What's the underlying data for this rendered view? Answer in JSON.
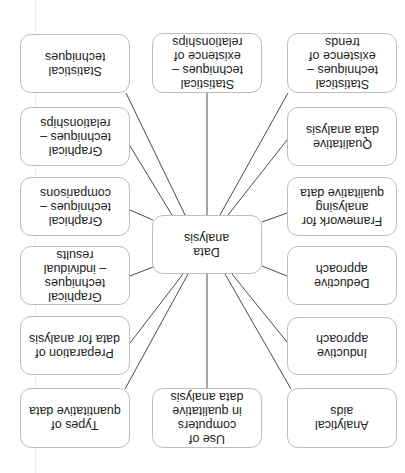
{
  "diagram": {
    "orientation": "rotated-180",
    "center": {
      "label": "Data\nanalysis"
    },
    "nodes": [
      {
        "id": "statistical-techniques",
        "label": "Statistical\ntechniques"
      },
      {
        "id": "graphical-relationships",
        "label": "Graphical\ntechniques –\nrelationships"
      },
      {
        "id": "graphical-comparisons",
        "label": "Graphical\ntechniques –\ncomparisons"
      },
      {
        "id": "graphical-individual-results",
        "label": "Graphical\ntechniques\n– individual results"
      },
      {
        "id": "preparation-of-data",
        "label": "Preparation of\ndata for analysis"
      },
      {
        "id": "types-of-quantitative-data",
        "label": "Types of\nquantitative data"
      },
      {
        "id": "statistical-relationships",
        "label": "Statistical\ntechniques –\nexistence of\nrelationships"
      },
      {
        "id": "use-of-computers",
        "label": "Use of computers\nin qualitative\ndata analysis"
      },
      {
        "id": "statistical-trends",
        "label": "Statistical\ntechniques –\nexistence of\ntrends"
      },
      {
        "id": "qualitative-data-analysis",
        "label": "Qualitative\ndata analysis"
      },
      {
        "id": "framework-qualitative",
        "label": "Framework for\nanalysing\nqualitative data"
      },
      {
        "id": "deductive-approach",
        "label": "Deductive\napproach"
      },
      {
        "id": "inductive-approach",
        "label": "Inductive\napproach"
      },
      {
        "id": "analytical-aids",
        "label": "Analytical\naids"
      }
    ],
    "colors": {
      "line": "#4a4a4a",
      "box_border": "#bdbdbd",
      "text": "#222222"
    }
  }
}
